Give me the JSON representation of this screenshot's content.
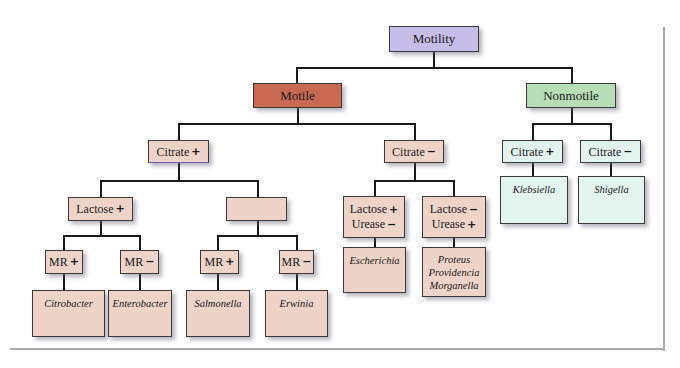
{
  "title": "Motility",
  "colors": {
    "root": "#c6bde8",
    "motile": "#c86a52",
    "nonmotile": "#b8dcb8",
    "motile_branch": "#eed3c9",
    "nonmotile_branch": "#e3f4ee",
    "connector": "#1a1a1a"
  },
  "nodes": {
    "root": {
      "label": "Motility"
    },
    "motile": {
      "label": "Motile"
    },
    "nonmotile": {
      "label": "Nonmotile"
    },
    "motile_citrate_pos": {
      "label": "Citrate",
      "sign": "+"
    },
    "motile_citrate_neg": {
      "label": "Citrate",
      "sign": "−"
    },
    "nonmotile_citrate_pos": {
      "label": "Citrate",
      "sign": "+"
    },
    "nonmotile_citrate_neg": {
      "label": "Citrate",
      "sign": "−"
    },
    "klebsiella": {
      "label": "Klebsiella"
    },
    "shigella": {
      "label": "Shigella"
    },
    "lactose_pos": {
      "label": "Lactose",
      "sign": "+"
    },
    "empty_box": {
      "label": ""
    },
    "lactose_pos_urease_neg": {
      "line1": "Lactose",
      "sign1": "+",
      "line2": "Urease",
      "sign2": "−"
    },
    "lactose_neg_urease_pos": {
      "line1": "Lactose",
      "sign1": "−",
      "line2": "Urease",
      "sign2": "+"
    },
    "escherichia": {
      "label": "Escherichia"
    },
    "proteus_group": {
      "line1": "Proteus",
      "line2": "Providencia",
      "line3": "Morganella"
    },
    "mr_pos_1": {
      "label": "MR",
      "sign": "+"
    },
    "mr_neg_1": {
      "label": "MR",
      "sign": "−"
    },
    "mr_pos_2": {
      "label": "MR",
      "sign": "+"
    },
    "mr_neg_2": {
      "label": "MR",
      "sign": "−"
    },
    "citrobacter": {
      "label": "Citrobacter"
    },
    "enterobacter": {
      "label": "Enterobacter"
    },
    "salmonella": {
      "label": "Salmonella"
    },
    "erwinia": {
      "label": "Erwinia"
    }
  }
}
